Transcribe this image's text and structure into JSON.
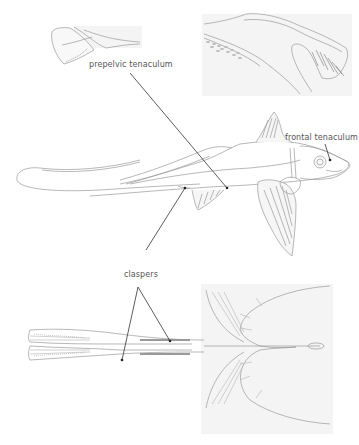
{
  "figure": {
    "labels": {
      "prepelvic": "prepelvic tenaculum",
      "frontal": "frontal tenaculum",
      "claspers": "claspers"
    },
    "colors": {
      "line": "#333333",
      "sketch": "#9a9a9a",
      "panel_bg": "#f3f3f3",
      "background": "#ffffff"
    },
    "insets": [
      {
        "name": "prepelvic-tenaculum-detail",
        "position": "top-left"
      },
      {
        "name": "frontal-tenaculum-detail",
        "position": "top-right"
      },
      {
        "name": "ventral-pelvic-view",
        "position": "bottom"
      }
    ]
  }
}
